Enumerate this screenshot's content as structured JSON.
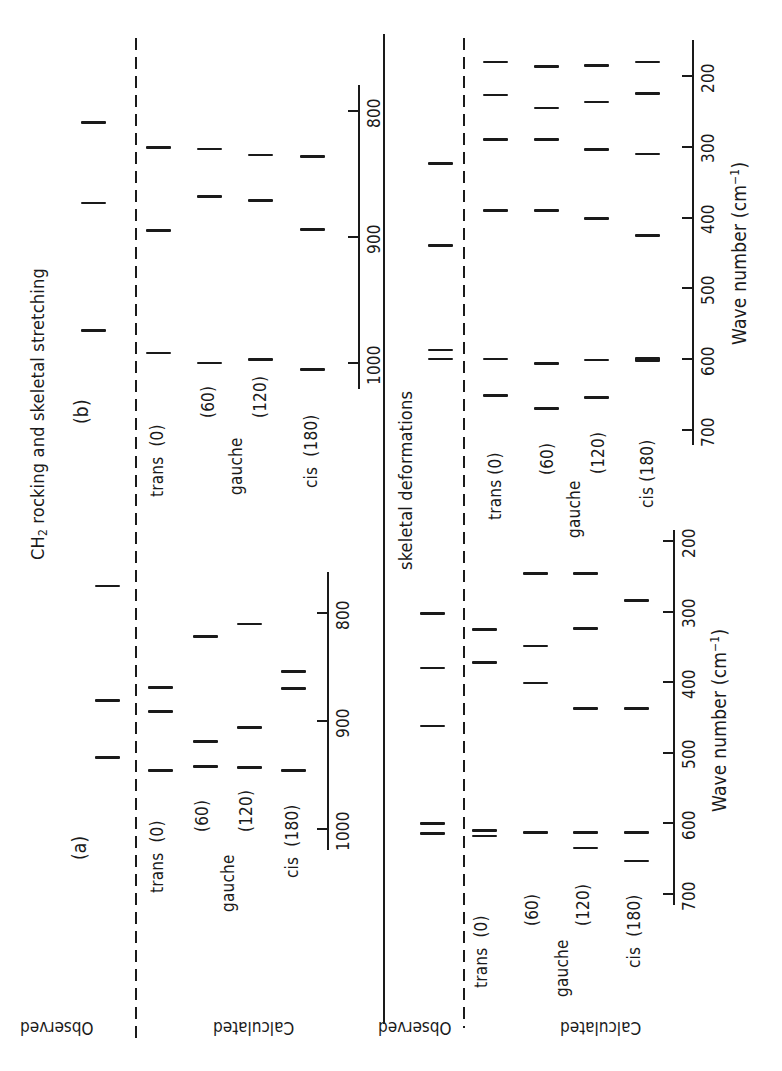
{
  "title": {
    "ch2_prefix": "CH",
    "ch2_sub": "2",
    "ch2_rest": " rocking and skeletal stretching",
    "skeletal": "skeletal deformations"
  },
  "panels": {
    "a": "(a)",
    "b": "(b)"
  },
  "row_labels": {
    "observed": "Observed",
    "calculated": "Calculated",
    "trans": "trans",
    "gauche": "gauche",
    "cis": "cis",
    "angle_0": "(0)",
    "angle_60": "(60)",
    "angle_120": "(120)",
    "angle_180": "(180)"
  },
  "axis": {
    "xlabel_main": "Wave number (cm",
    "xlabel_sup": "−1",
    "xlabel_close": ")",
    "ch2_ticks": [
      "800",
      "900",
      "1000"
    ],
    "skel_ticks": [
      "200",
      "300",
      "400",
      "500",
      "600",
      "700"
    ]
  },
  "chart_data": [
    {
      "type": "stick-spectrum",
      "title": "CH2 rocking and skeletal stretching (b)",
      "xlabel": "Wave number (cm-1)",
      "xlim": [
        780,
        1020
      ],
      "ticks": [
        800,
        900,
        1000
      ],
      "series": [
        {
          "name": "Observed",
          "values": [
            809,
            873,
            974
          ]
        },
        {
          "name": "Calculated trans (0)",
          "values": [
            829,
            895,
            992
          ]
        },
        {
          "name": "Calculated gauche (60)",
          "values": [
            830,
            868,
            1000
          ]
        },
        {
          "name": "Calculated gauche (120)",
          "values": [
            835,
            871,
            997
          ]
        },
        {
          "name": "Calculated cis (180)",
          "values": [
            836,
            894,
            1005
          ]
        }
      ]
    },
    {
      "type": "stick-spectrum",
      "title": "CH2 rocking and skeletal stretching (a)",
      "xlabel": "Wave number (cm-1)",
      "xlim": [
        760,
        1020
      ],
      "ticks": [
        800,
        900,
        1000
      ],
      "series": [
        {
          "name": "Observed",
          "values": [
            775,
            881,
            934
          ]
        },
        {
          "name": "Calculated trans (0)",
          "values": [
            869,
            891,
            946
          ]
        },
        {
          "name": "Calculated gauche (60)",
          "values": [
            822,
            919,
            942
          ]
        },
        {
          "name": "Calculated gauche (120)",
          "values": [
            810,
            906,
            943
          ]
        },
        {
          "name": "Calculated cis (180)",
          "values": [
            854,
            870,
            946
          ]
        }
      ]
    },
    {
      "type": "stick-spectrum",
      "title": "skeletal deformations (b)",
      "xlabel": "Wave number (cm-1)",
      "xlim": [
        160,
        720
      ],
      "ticks": [
        200,
        300,
        400,
        500,
        600,
        700
      ],
      "series": [
        {
          "name": "Observed",
          "values": [
            324,
            439,
            587,
            600
          ]
        },
        {
          "name": "Calculated trans (0)",
          "values": [
            180,
            227,
            290,
            390,
            600,
            651
          ]
        },
        {
          "name": "Calculated gauche (60)",
          "values": [
            187,
            245,
            290,
            390,
            606,
            670
          ]
        },
        {
          "name": "Calculated gauche (120)",
          "values": [
            185,
            237,
            304,
            401,
            601,
            654
          ]
        },
        {
          "name": "Calculated cis (180)",
          "values": [
            180,
            225,
            310,
            425,
            600
          ]
        }
      ]
    },
    {
      "type": "stick-spectrum",
      "title": "skeletal deformations (a)",
      "xlabel": "Wave number (cm-1)",
      "xlim": [
        180,
        710
      ],
      "ticks": [
        200,
        300,
        400,
        500,
        600,
        700
      ],
      "series": [
        {
          "name": "Observed",
          "values": [
            303,
            380,
            462,
            600,
            614
          ]
        },
        {
          "name": "Calculated trans (0)",
          "values": [
            325,
            372,
            610,
            618
          ]
        },
        {
          "name": "Calculated gauche (60)",
          "values": [
            246,
            349,
            401,
            613
          ]
        },
        {
          "name": "Calculated gauche (120)",
          "values": [
            246,
            324,
            437,
            613,
            635
          ]
        },
        {
          "name": "Calculated cis (180)",
          "values": [
            284,
            437,
            613,
            653
          ]
        }
      ]
    }
  ],
  "layout": {
    "groups": [
      {
        "id": "ch2_b",
        "axis_x": 358,
        "tick_y": {
          "800": 111,
          "900": 236,
          "1000": 363
        },
        "axis_y": [
          85,
          389
        ],
        "cols": [
          93,
          158,
          209,
          260,
          312
        ],
        "thick_idx": []
      },
      {
        "id": "ch2_a",
        "axis_x": 327,
        "tick_y": {
          "800": 613,
          "900": 722,
          "1000": 829
        },
        "axis_y": [
          572,
          850
        ],
        "cols": [
          107,
          160,
          205,
          249,
          293
        ],
        "thick_idx": []
      },
      {
        "id": "skel_b",
        "axis_x": 692,
        "tick_y": {
          "200": 76,
          "700": 430
        },
        "axis_y": [
          40,
          445
        ],
        "cols": [
          440,
          495,
          546,
          596,
          647
        ],
        "thick": [
          [
            4,
            4
          ]
        ]
      },
      {
        "id": "skel_a",
        "axis_x": 673,
        "tick_y": {
          "200": 541,
          "700": 894
        },
        "axis_y": [
          530,
          905
        ],
        "cols": [
          432,
          484,
          535,
          585,
          636
        ],
        "thick": []
      }
    ]
  }
}
